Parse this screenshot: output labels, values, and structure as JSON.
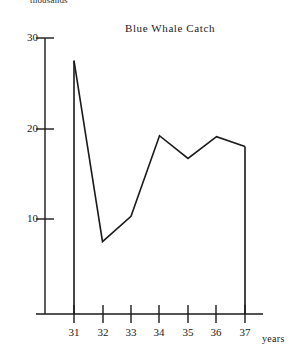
{
  "chart_data": {
    "type": "line",
    "title": "Blue Whale Catch",
    "xlabel": "years",
    "ylabel": "thousands",
    "x": [
      31,
      32,
      33,
      34,
      35,
      36,
      37
    ],
    "categories": [
      "31",
      "32",
      "33",
      "34",
      "35",
      "36",
      "37"
    ],
    "values": [
      27.5,
      7.5,
      10.3,
      19.2,
      16.7,
      19.1,
      18.0
    ],
    "series": [
      {
        "name": "Blue Whale Catch",
        "values": [
          27.5,
          7.5,
          10.3,
          19.2,
          16.7,
          19.1,
          18.0
        ]
      }
    ],
    "ylim": [
      0,
      30
    ],
    "xlim": [
      31,
      37
    ],
    "yticks": [
      10,
      20,
      30
    ],
    "ytick_labels": [
      "10",
      "20",
      "30"
    ],
    "xticks": [
      31,
      32,
      33,
      34,
      35,
      36,
      37
    ],
    "xtick_labels": [
      "31",
      "32",
      "33",
      "34",
      "35",
      "36",
      "37"
    ],
    "grid": false,
    "legend": false,
    "line_color": "#1a1a1a",
    "axis_color": "#1a1a1a",
    "background": "#ffffff",
    "annotations": [
      "vertical drop line from first point down to x-axis",
      "vertical drop line from last point down to x-axis"
    ]
  },
  "labels": {
    "title": "Blue Whale Catch",
    "y_unit": "thousands",
    "x_axis_name": "years",
    "y_30": "30",
    "y_20": "20",
    "y_10": "10",
    "x_31": "31",
    "x_32": "32",
    "x_33": "33",
    "x_34": "34",
    "x_35": "35",
    "x_36": "36",
    "x_37": "37"
  }
}
